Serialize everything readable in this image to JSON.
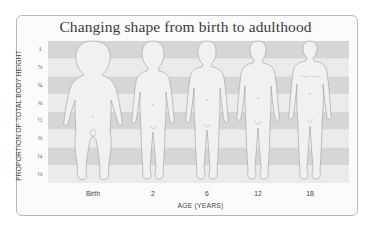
{
  "diagram": {
    "title": "Changing shape from birth to adulthood",
    "y_axis_label": "PROPORTION OF TOTAL BODY HEIGHT",
    "x_axis_label": "AGE (YEARS)",
    "y_ticks": [
      "1",
      "⅞",
      "¾",
      "⅝",
      "½",
      "⅜",
      "¼",
      "⅛"
    ],
    "x_ticks": [
      "Birth",
      "2",
      "6",
      "12",
      "18"
    ],
    "figures": [
      {
        "age": "Birth",
        "head_fraction": "1/4"
      },
      {
        "age": "2",
        "head_fraction": "1/5"
      },
      {
        "age": "6",
        "head_fraction": "1/6"
      },
      {
        "age": "12",
        "head_fraction": "1/7"
      },
      {
        "age": "18",
        "head_fraction": "1/8"
      }
    ],
    "colors": {
      "band_dark": "#d6d6d6",
      "band_light": "#ebebeb",
      "figure_fill": "#f0f0f0",
      "figure_stroke": "#a9a9a9",
      "card_border": "#b9b9b9",
      "text": "#3a3a3a"
    }
  }
}
